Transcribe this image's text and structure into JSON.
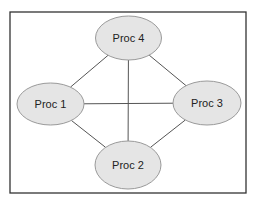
{
  "diagram": {
    "frame": {
      "x": 10,
      "y": 12,
      "width": 236,
      "height": 181,
      "stroke": "#333333"
    },
    "node_style": {
      "fill": "#e5e5e5",
      "stroke": "#9a9a9a"
    },
    "edge_style": {
      "stroke": "#555555"
    },
    "nodes": [
      {
        "id": "p4",
        "label": "Proc 4",
        "cx": 128.5,
        "cy": 38,
        "rx": 33,
        "ry": 22
      },
      {
        "id": "p1",
        "label": "Proc 1",
        "cx": 50.5,
        "cy": 104,
        "rx": 33.5,
        "ry": 21
      },
      {
        "id": "p3",
        "label": "Proc 3",
        "cx": 207,
        "cy": 103,
        "rx": 34,
        "ry": 22
      },
      {
        "id": "p2",
        "label": "Proc 2",
        "cx": 128,
        "cy": 165,
        "rx": 33,
        "ry": 24
      }
    ],
    "edges": [
      {
        "from": "p4",
        "to": "p1"
      },
      {
        "from": "p4",
        "to": "p3"
      },
      {
        "from": "p4",
        "to": "p2"
      },
      {
        "from": "p1",
        "to": "p3"
      },
      {
        "from": "p1",
        "to": "p2"
      },
      {
        "from": "p3",
        "to": "p2"
      }
    ]
  }
}
